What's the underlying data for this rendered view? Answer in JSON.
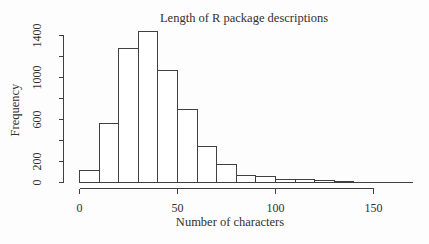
{
  "window": {
    "width": 429,
    "height": 244,
    "background": "#fdfdfd"
  },
  "chart_data": {
    "type": "bar",
    "subtype": "histogram",
    "title": "Length of R package descriptions",
    "xlabel": "Number of characters",
    "ylabel": "Frequency",
    "bin_start": 0,
    "bin_width": 10,
    "categories": [
      "0-10",
      "10-20",
      "20-30",
      "30-40",
      "40-50",
      "50-60",
      "60-70",
      "70-80",
      "80-90",
      "90-100",
      "100-110",
      "110-120",
      "120-130",
      "130-140",
      "140-150",
      "150-160",
      "160-170"
    ],
    "values": [
      115,
      560,
      1280,
      1435,
      1070,
      700,
      340,
      170,
      70,
      55,
      32,
      25,
      18,
      10,
      4,
      3,
      2
    ],
    "xlim": [
      0,
      150
    ],
    "ylim": [
      0,
      1400
    ],
    "x_ticks": [
      0,
      50,
      100,
      150
    ],
    "y_ticks": [
      0,
      200,
      400,
      600,
      800,
      1000,
      1200,
      1400
    ],
    "y_tick_labels_shown": [
      0,
      200,
      600,
      1000,
      1400
    ],
    "grid": false,
    "legend_position": "none",
    "bar_fill": "#ffffff",
    "stroke_color": "#404040",
    "text_color": "#303030"
  }
}
